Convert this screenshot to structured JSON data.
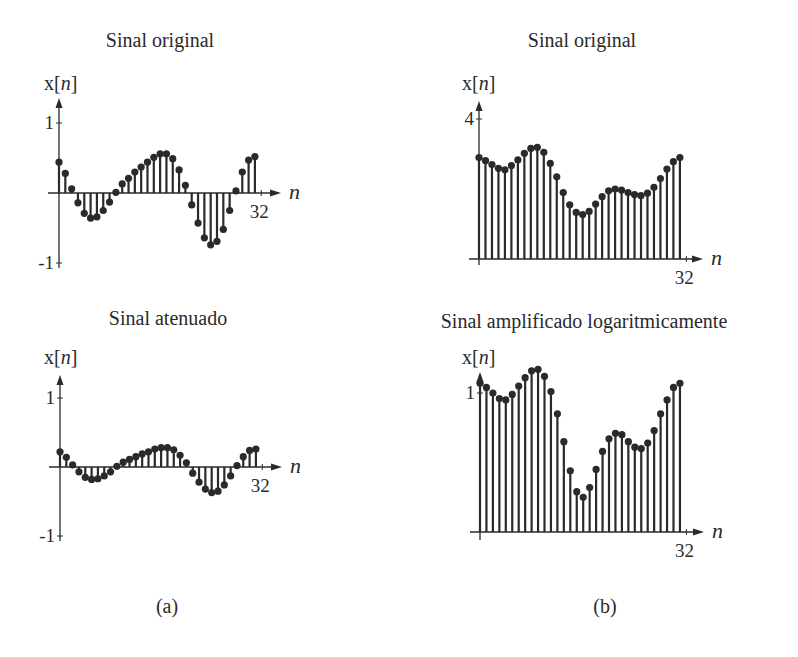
{
  "figure": {
    "panel_labels": [
      {
        "text": "(a)",
        "x": 167,
        "y": 613
      },
      {
        "text": "(b)",
        "x": 605,
        "y": 613
      }
    ]
  },
  "style": {
    "ink": "#2a2a2a",
    "background": "#ffffff"
  },
  "chart_data": [
    {
      "type": "stem",
      "title": "Sinal original",
      "xlabel": "n",
      "ylabel": "x[n]",
      "ylabel_italic_part": "n",
      "x_end_tick_label": "32",
      "y_ticks": [
        {
          "value": 1,
          "label": "1"
        },
        {
          "value": -1,
          "label": "-1"
        }
      ],
      "ylim": [
        -1,
        1
      ],
      "xlim": [
        0,
        32
      ],
      "n": [
        0,
        1,
        2,
        3,
        4,
        5,
        6,
        7,
        8,
        9,
        10,
        11,
        12,
        13,
        14,
        15,
        16,
        17,
        18,
        19,
        20,
        21,
        22,
        23,
        24,
        25,
        26,
        27,
        28,
        29,
        30,
        31
      ],
      "values": [
        0.44,
        0.28,
        0.06,
        -0.14,
        -0.29,
        -0.36,
        -0.34,
        -0.25,
        -0.13,
        0.01,
        0.13,
        0.21,
        0.3,
        0.37,
        0.44,
        0.51,
        0.56,
        0.56,
        0.49,
        0.33,
        0.11,
        -0.17,
        -0.43,
        -0.64,
        -0.74,
        -0.69,
        -0.52,
        -0.25,
        0.03,
        0.3,
        0.47,
        0.52
      ],
      "layout": {
        "origin_x": 59,
        "origin_y": 193,
        "px_per_unit_y": 70,
        "px_per_n": 6.32,
        "y_axis_top": 98,
        "y_axis_bottom": 268,
        "x_axis_left": 48,
        "x_axis_right": 281,
        "title_x": 160,
        "title_y": 47,
        "ylab_x": 44,
        "ylab_y": 90
      }
    },
    {
      "type": "stem",
      "title": "Sinal atenuado",
      "xlabel": "n",
      "ylabel": "x[n]",
      "ylabel_italic_part": "n",
      "x_end_tick_label": "32",
      "y_ticks": [
        {
          "value": 1,
          "label": "1"
        },
        {
          "value": -1,
          "label": "-1"
        }
      ],
      "ylim": [
        -1,
        1
      ],
      "xlim": [
        0,
        32
      ],
      "n": [
        0,
        1,
        2,
        3,
        4,
        5,
        6,
        7,
        8,
        9,
        10,
        11,
        12,
        13,
        14,
        15,
        16,
        17,
        18,
        19,
        20,
        21,
        22,
        23,
        24,
        25,
        26,
        27,
        28,
        29,
        30,
        31
      ],
      "values": [
        0.22,
        0.14,
        0.03,
        -0.07,
        -0.15,
        -0.18,
        -0.17,
        -0.13,
        -0.07,
        0.01,
        0.07,
        0.11,
        0.15,
        0.19,
        0.22,
        0.26,
        0.28,
        0.28,
        0.25,
        0.17,
        0.06,
        -0.09,
        -0.22,
        -0.32,
        -0.37,
        -0.35,
        -0.26,
        -0.13,
        0.02,
        0.15,
        0.24,
        0.26
      ],
      "layout": {
        "origin_x": 60,
        "origin_y": 467,
        "px_per_unit_y": 69,
        "px_per_n": 6.32,
        "y_axis_top": 375,
        "y_axis_bottom": 541,
        "x_axis_left": 49,
        "x_axis_right": 282,
        "title_x": 168,
        "title_y": 325,
        "ylab_x": 44,
        "ylab_y": 364
      }
    },
    {
      "type": "stem",
      "title": "Sinal original",
      "xlabel": "n",
      "ylabel": "x[n]",
      "ylabel_italic_part": "n",
      "x_end_tick_label": "32",
      "y_ticks": [
        {
          "value": 4,
          "label": "4"
        }
      ],
      "ylim": [
        0,
        4
      ],
      "xlim": [
        0,
        32
      ],
      "n": [
        0,
        1,
        2,
        3,
        4,
        5,
        6,
        7,
        8,
        9,
        10,
        11,
        12,
        13,
        14,
        15,
        16,
        17,
        18,
        19,
        20,
        21,
        22,
        23,
        24,
        25,
        26,
        27,
        28,
        29,
        30,
        31
      ],
      "values": [
        2.9,
        2.81,
        2.7,
        2.59,
        2.55,
        2.67,
        2.83,
        3.02,
        3.16,
        3.19,
        3.05,
        2.73,
        2.35,
        1.9,
        1.55,
        1.33,
        1.27,
        1.36,
        1.57,
        1.78,
        1.95,
        2.0,
        1.97,
        1.9,
        1.84,
        1.81,
        1.88,
        2.05,
        2.3,
        2.57,
        2.78,
        2.9
      ],
      "layout": {
        "origin_x": 479,
        "origin_y": 259,
        "px_per_unit_y": 35,
        "px_per_n": 6.48,
        "y_axis_top": 101,
        "y_axis_bottom": 265,
        "x_axis_left": 469,
        "x_axis_right": 703,
        "title_x": 582,
        "title_y": 47,
        "ylab_x": 462,
        "ylab_y": 90
      }
    },
    {
      "type": "stem",
      "title": "Sinal amplificado logaritmicamente",
      "xlabel": "n",
      "ylabel": "x[n]",
      "ylabel_italic_part": "n",
      "x_end_tick_label": "32",
      "y_ticks": [
        {
          "value": 1,
          "label": "1"
        }
      ],
      "ylim": [
        0,
        1.2
      ],
      "xlim": [
        0,
        32
      ],
      "n": [
        0,
        1,
        2,
        3,
        4,
        5,
        6,
        7,
        8,
        9,
        10,
        11,
        12,
        13,
        14,
        15,
        16,
        17,
        18,
        19,
        20,
        21,
        22,
        23,
        24,
        25,
        26,
        27,
        28,
        29,
        30,
        31
      ],
      "values": [
        1.07,
        1.04,
        1.0,
        0.96,
        0.95,
        0.99,
        1.05,
        1.11,
        1.16,
        1.17,
        1.12,
        1.01,
        0.85,
        0.65,
        0.44,
        0.29,
        0.25,
        0.32,
        0.45,
        0.58,
        0.67,
        0.71,
        0.7,
        0.65,
        0.61,
        0.6,
        0.64,
        0.73,
        0.85,
        0.95,
        1.04,
        1.07
      ],
      "layout": {
        "origin_x": 480,
        "origin_y": 532,
        "px_per_unit_y": 139,
        "px_per_n": 6.45,
        "y_axis_top": 372,
        "y_axis_bottom": 540,
        "x_axis_left": 470,
        "x_axis_right": 704,
        "title_x": 584,
        "title_y": 328,
        "ylab_x": 462,
        "ylab_y": 364
      }
    }
  ]
}
